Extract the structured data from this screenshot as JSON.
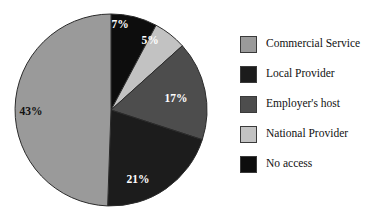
{
  "chart_data": {
    "type": "pie",
    "title": "",
    "subtitle": "",
    "xlabel": "",
    "ylabel": "",
    "grid": false,
    "legend_position": "right",
    "units": "percent",
    "start_angle_deg": 0,
    "direction": "clockwise",
    "categories": [
      "Commercial Service",
      "Local Provider",
      "Employer's host",
      "National Provider",
      "No access"
    ],
    "values": [
      43,
      21,
      17,
      5,
      7
    ],
    "slices": [
      {
        "label": "No access",
        "value": 7,
        "data_label": "7%",
        "color": "#0d0d0d",
        "label_color": "#ffffff",
        "start_deg": 0,
        "end_deg": 28,
        "label_x": 120,
        "label_y": 28
      },
      {
        "label": "National Provider",
        "value": 5,
        "data_label": "5%",
        "color": "#c2c2c2",
        "label_color": "#ffffff",
        "start_deg": 28,
        "end_deg": 48,
        "label_x": 150,
        "label_y": 44
      },
      {
        "label": "Employer's host",
        "value": 17,
        "data_label": "17%",
        "color": "#4d4d4d",
        "label_color": "#ffffff",
        "start_deg": 48,
        "end_deg": 108,
        "label_x": 176,
        "label_y": 102
      },
      {
        "label": "Local Provider",
        "value": 21,
        "data_label": "21%",
        "color": "#1c1c1c",
        "label_color": "#ffffff",
        "start_deg": 108,
        "end_deg": 182,
        "label_x": 138,
        "label_y": 183
      },
      {
        "label": "Commercial Service",
        "value": 43,
        "data_label": "43%",
        "color": "#9a9a9a",
        "label_color": "#111111",
        "start_deg": 182,
        "end_deg": 360,
        "label_x": 31,
        "label_y": 115
      }
    ],
    "geometry": {
      "center_x": 111,
      "center_y": 110,
      "radius": 96,
      "outline_color": "#2b2b2b"
    }
  },
  "legend": {
    "items": [
      {
        "label": "Commercial Service",
        "color": "#9a9a9a"
      },
      {
        "label": "Local Provider",
        "color": "#1c1c1c"
      },
      {
        "label": "Employer's host",
        "color": "#4d4d4d"
      },
      {
        "label": "National Provider",
        "color": "#c2c2c2"
      },
      {
        "label": "No access",
        "color": "#0d0d0d"
      }
    ]
  }
}
